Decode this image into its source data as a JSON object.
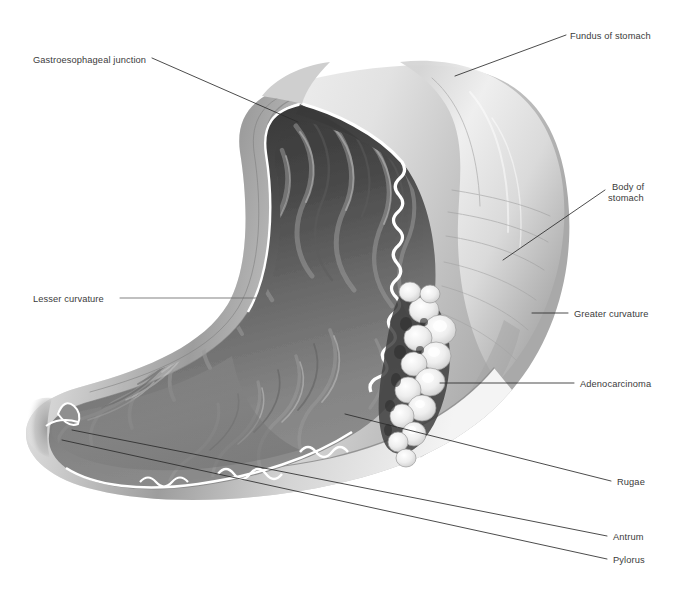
{
  "figure": {
    "style": "grayscale-medical-illustration",
    "background_color": "#ffffff",
    "label_color": "#3b3b3b",
    "leader_color": "#2c2c2c"
  },
  "labels": {
    "gastroesophageal_junction": "Gastroesophageal junction",
    "fundus_of_stomach": "Fundus of stomach",
    "body_of_stomach_line1": "Body of",
    "body_of_stomach_line2": "stomach",
    "greater_curvature": "Greater curvature",
    "adenocarcinoma": "Adenocarcinoma",
    "rugae": "Rugae",
    "antrum": "Antrum",
    "pylorus": "Pylorus",
    "lesser_curvature": "Lesser curvature"
  },
  "annotations": [
    {
      "name": "gastroesophageal-junction",
      "text": "Gastroesophageal junction",
      "side": "left",
      "text_x": 33,
      "text_y": 55,
      "leader": [
        [
          152,
          58
        ],
        [
          298,
          122
        ]
      ]
    },
    {
      "name": "lesser-curvature",
      "text": "Lesser curvature",
      "side": "left",
      "text_x": 33,
      "text_y": 294,
      "leader": [
        [
          120,
          298
        ],
        [
          268,
          298
        ]
      ]
    },
    {
      "name": "fundus-of-stomach",
      "text": "Fundus of stomach",
      "side": "right",
      "text_x": 570,
      "text_y": 31,
      "leader": [
        [
          566,
          35
        ],
        [
          455,
          76
        ]
      ]
    },
    {
      "name": "body-of-stomach",
      "text": "Body of stomach",
      "side": "right",
      "text_x": 612,
      "text_y": 182,
      "leader": [
        [
          605,
          190
        ],
        [
          503,
          260
        ]
      ]
    },
    {
      "name": "greater-curvature",
      "text": "Greater curvature",
      "side": "right",
      "text_x": 574,
      "text_y": 309,
      "leader": [
        [
          568,
          313
        ],
        [
          534,
          313
        ]
      ]
    },
    {
      "name": "adenocarcinoma",
      "text": "Adenocarcinoma",
      "side": "right",
      "text_x": 580,
      "text_y": 379,
      "leader": [
        [
          574,
          383
        ],
        [
          440,
          383
        ]
      ]
    },
    {
      "name": "rugae",
      "text": "Rugae",
      "side": "right",
      "text_x": 617,
      "text_y": 477,
      "leader": [
        [
          611,
          481
        ],
        [
          345,
          414
        ]
      ]
    },
    {
      "name": "antrum",
      "text": "Antrum",
      "side": "right",
      "text_x": 613,
      "text_y": 532,
      "leader": [
        [
          607,
          536
        ],
        [
          72,
          430
        ]
      ]
    },
    {
      "name": "pylorus",
      "text": "Pylorus",
      "side": "right",
      "text_x": 613,
      "text_y": 555,
      "leader": [
        [
          607,
          559
        ],
        [
          62,
          440
        ]
      ]
    }
  ],
  "anatomy": {
    "organ": "stomach",
    "view": "anterior cutaway / coronal section",
    "serosa_tone": "#c9c9c9",
    "lumen_tone_dark": "#3c3c3c",
    "lumen_tone_mid": "#7e7e7e",
    "mucosa_edge_tone": "#ffffff",
    "tumor_tone": "#f2f2f2",
    "regions": [
      "fundus",
      "body",
      "antrum",
      "pylorus",
      "greater curvature",
      "lesser curvature",
      "rugae",
      "gastroesophageal junction"
    ],
    "pathology": "adenocarcinoma along greater curvature, nodular cauliflower mass"
  }
}
